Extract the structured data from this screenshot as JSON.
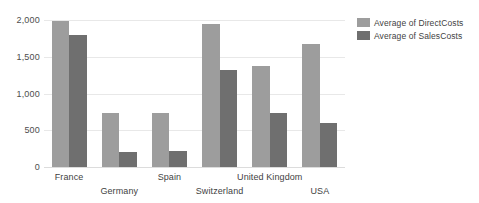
{
  "chart_data": {
    "type": "bar",
    "title": "",
    "subtitle": "",
    "xlabel": "",
    "ylabel": "",
    "orientation": "vertical",
    "grouping": "grouped",
    "grid": true,
    "grid_axis": "y",
    "legend_position": "right",
    "categories": [
      "France",
      "Germany",
      "Spain",
      "Switzerland",
      "United Kingdom",
      "USA"
    ],
    "series": [
      {
        "name": "Average of DirectCosts",
        "color": "#9d9d9d",
        "values": [
          1990,
          730,
          740,
          1950,
          1380,
          1670
        ]
      },
      {
        "name": "Average of SalesCosts",
        "color": "#6f6f6f",
        "values": [
          1790,
          210,
          215,
          1320,
          740,
          605
        ]
      }
    ],
    "ylim": [
      0,
      2000
    ],
    "ytick_values": [
      0,
      500,
      1000,
      1500,
      2000
    ],
    "ytick_labels": [
      "0",
      "500",
      "1,000",
      "1,500",
      "2,000"
    ],
    "xtick_label_rows": [
      0,
      1,
      0,
      1,
      0,
      1
    ]
  },
  "legend": {
    "items": [
      {
        "label": "Average of DirectCosts",
        "color": "#9d9d9d"
      },
      {
        "label": "Average of SalesCosts",
        "color": "#6f6f6f"
      }
    ]
  },
  "colors": {
    "background": "#ffffff",
    "gridline": "#e8e8e8",
    "baseline": "#dcdcdc",
    "tick_text": "#4d4d4d",
    "label_text": "#3f3f3f",
    "series_direct_costs": "#9d9d9d",
    "series_sales_costs": "#6f6f6f"
  }
}
